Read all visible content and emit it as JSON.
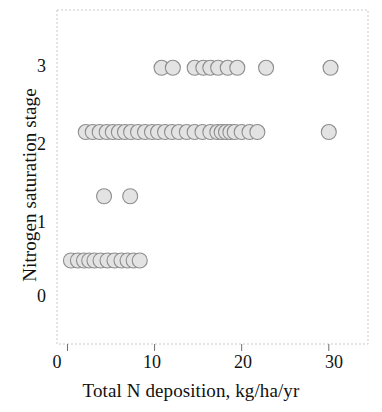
{
  "chart_data": {
    "type": "scatter",
    "title": "",
    "xlabel": "Total N deposition, kg/ha/yr",
    "ylabel": "Nitrogen saturation stage",
    "xlim": [
      -1.2,
      34.5
    ],
    "ylim": [
      -1.3,
      3.9
    ],
    "xticks": [
      0,
      10,
      20,
      30
    ],
    "xtick_labels": [
      "0",
      "10",
      "20",
      "30"
    ],
    "yticks": [
      0,
      1,
      2,
      3
    ],
    "ytick_labels": [
      "0",
      "1",
      "2",
      "3"
    ],
    "grid": false,
    "legend": "none",
    "marker": {
      "shape": "circle",
      "fill_color": "#e3e3e3",
      "edge_color": "#8d8d8d",
      "radius_px": 7.5,
      "edge_width_px": 1.1
    },
    "frame_color": "#c9c9c9",
    "series": [
      {
        "name": "Sites",
        "x": [
          0.4,
          1.2,
          1.9,
          2.5,
          3.1,
          3.8,
          4.6,
          5.4,
          6.2,
          6.9,
          7.6,
          8.3,
          4.2,
          7.2,
          2.1,
          2.9,
          3.7,
          4.5,
          5.2,
          5.9,
          6.6,
          7.3,
          8.1,
          8.9,
          9.7,
          10.4,
          11.2,
          12.0,
          12.8,
          13.7,
          14.6,
          15.5,
          16.4,
          17.2,
          17.7,
          18.2,
          18.7,
          19.2,
          20.0,
          20.9,
          21.8,
          30.0,
          10.8,
          12.1,
          14.6,
          15.6,
          16.4,
          17.3,
          18.4,
          19.5,
          22.8,
          30.2
        ],
        "y": [
          0,
          0,
          0,
          0,
          0,
          0,
          0,
          0,
          0,
          0,
          0,
          0,
          1,
          1,
          2,
          2,
          2,
          2,
          2,
          2,
          2,
          2,
          2,
          2,
          2,
          2,
          2,
          2,
          2,
          2,
          2,
          2,
          2,
          2,
          2,
          2,
          2,
          2,
          2,
          2,
          2,
          2,
          3,
          3,
          3,
          3,
          3,
          3,
          3,
          3,
          3,
          3
        ]
      }
    ],
    "counts_by_stage": {
      "stage_0": 12,
      "stage_1": 2,
      "stage_2": 28,
      "stage_3": 10
    }
  }
}
